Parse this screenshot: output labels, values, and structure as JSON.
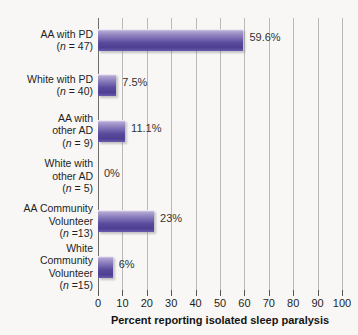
{
  "chart_data": {
    "type": "bar",
    "orientation": "horizontal",
    "title": "",
    "xlabel": "Percent reporting isolated sleep paralysis",
    "ylabel": "",
    "xlim": [
      0,
      100
    ],
    "xticks": [
      "0",
      "10",
      "20",
      "30",
      "40",
      "50",
      "60",
      "70",
      "80",
      "90",
      "100"
    ],
    "grid": "vertical",
    "legend": "none",
    "categories": [
      "AA with PD (n = 47)",
      "White with PD (n = 40)",
      "AA with other AD (n = 9)",
      "White with other AD (n = 5)",
      "AA Community Volunteer (n =13)",
      "White Community Volunteer (n =15)"
    ],
    "values": [
      59.6,
      7.5,
      11.1,
      0,
      23,
      6
    ],
    "value_labels": [
      "59.6%",
      "7.5%",
      "11.1%",
      "0%",
      "23%",
      "6%"
    ],
    "bars": [
      {
        "name_lines": [
          "AA with PD"
        ],
        "n_prefix": "(",
        "n_italic": "n",
        "n_suffix": " = 47)",
        "value": 59.6,
        "value_label": "59.6%"
      },
      {
        "name_lines": [
          "White with PD"
        ],
        "n_prefix": "(",
        "n_italic": "n",
        "n_suffix": " = 40)",
        "value": 7.5,
        "value_label": "7.5%"
      },
      {
        "name_lines": [
          "AA with",
          "other AD"
        ],
        "n_prefix": "(",
        "n_italic": "n",
        "n_suffix": " = 9)",
        "value": 11.1,
        "value_label": "11.1%"
      },
      {
        "name_lines": [
          "White with",
          "other AD"
        ],
        "n_prefix": "(",
        "n_italic": "n",
        "n_suffix": " = 5)",
        "value": 0,
        "value_label": "0%"
      },
      {
        "name_lines": [
          "AA Community",
          "Volunteer"
        ],
        "n_prefix": "(",
        "n_italic": "n",
        "n_suffix": " =13)",
        "value": 23,
        "value_label": "23%"
      },
      {
        "name_lines": [
          "White",
          "Community",
          "Volunteer"
        ],
        "n_prefix": "(",
        "n_italic": "n",
        "n_suffix": " =15)",
        "value": 6,
        "value_label": "6%"
      }
    ],
    "colors": {
      "bar_light": "#b3a7d2",
      "bar_mid": "#8d7fbe",
      "bar_dark": "#4e3f93",
      "gridline": "#b9b9b9",
      "axis": "#6e6e6e",
      "background": "#f8f7f5",
      "text": "#1f1f1f"
    }
  }
}
